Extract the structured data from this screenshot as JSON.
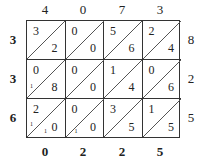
{
  "multiplicand_digits": [
    "4",
    "0",
    "7",
    "3"
  ],
  "multiplier_digits": [
    "3",
    "3",
    "6"
  ],
  "product_right": [
    "8",
    "2",
    "5"
  ],
  "product_bottom": [
    "0",
    "2",
    "2",
    "5"
  ],
  "cells": [
    [
      {
        "tens": "3",
        "ones": "2"
      },
      {
        "tens": "0",
        "ones": "0"
      },
      {
        "tens": "5",
        "ones": "6"
      },
      {
        "tens": "2",
        "ones": "4"
      }
    ],
    [
      {
        "tens": "0",
        "ones": "8"
      },
      {
        "tens": "0",
        "ones": "0"
      },
      {
        "tens": "1",
        "ones": "4"
      },
      {
        "tens": "0",
        "ones": "6"
      }
    ],
    [
      {
        "tens": "2",
        "ones": "0"
      },
      {
        "tens": "0",
        "ones": "0"
      },
      {
        "tens": "3",
        "ones": "5"
      },
      {
        "tens": "1",
        "ones": "5"
      }
    ]
  ],
  "carries": {
    "r1c0": "1",
    "r2c0_left": "1",
    "r2c0_bottom": "1",
    "r2c1": "1"
  }
}
